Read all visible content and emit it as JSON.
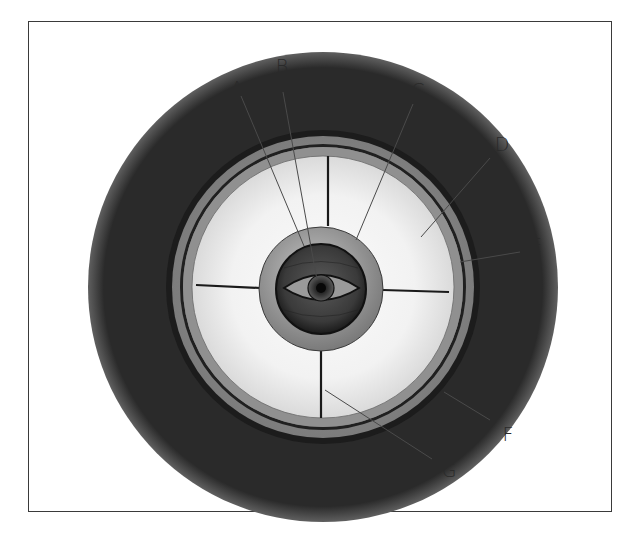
{
  "diagram": {
    "type": "labeled-cross-section",
    "colors": {
      "frame": "#3a3a3a",
      "outer_ring": "#1c1c1c",
      "band": "#8c8c8c",
      "inner_ring": "#202020",
      "lens": "#f0f0f0",
      "core_ring": "#9a9a9a",
      "globe": "#3c3c3c",
      "leader": "#4a4a4a"
    },
    "labels": [
      {
        "id": "A",
        "text": "A",
        "x": 237,
        "y": 88
      },
      {
        "id": "B",
        "text": "B",
        "x": 282,
        "y": 66
      },
      {
        "id": "C",
        "text": "C",
        "x": 418,
        "y": 90
      },
      {
        "id": "D",
        "text": "D",
        "x": 502,
        "y": 144
      },
      {
        "id": "E",
        "text": "E",
        "x": 536,
        "y": 245
      },
      {
        "id": "F",
        "text": "F",
        "x": 508,
        "y": 434
      },
      {
        "id": "G",
        "text": "G",
        "x": 449,
        "y": 470
      }
    ]
  }
}
